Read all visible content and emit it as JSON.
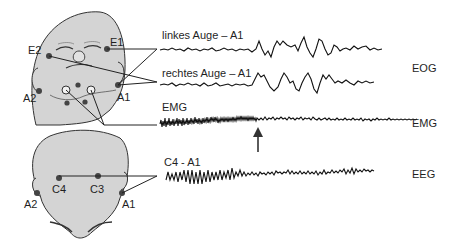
{
  "figure": {
    "face_electrodes": [
      {
        "id": "E1",
        "label": "E1"
      },
      {
        "id": "E2",
        "label": "E2"
      },
      {
        "id": "A1",
        "label": "A1"
      },
      {
        "id": "A2",
        "label": "A2"
      }
    ],
    "back_electrodes": [
      {
        "id": "C4",
        "label": "C4"
      },
      {
        "id": "C3",
        "label": "C3"
      },
      {
        "id": "A1",
        "label": "A1"
      },
      {
        "id": "A2",
        "label": "A2"
      }
    ],
    "traces": [
      {
        "name": "left-eye",
        "label": "linkes Auge – A1"
      },
      {
        "name": "right-eye",
        "label": "rechtes Auge – A1"
      },
      {
        "name": "emg",
        "label": "EMG"
      },
      {
        "name": "eeg",
        "label": "C4 - A1"
      }
    ],
    "channel_labels": {
      "eog": "EOG",
      "emg": "EMG",
      "eeg": "EEG"
    },
    "colors": {
      "skin": "#d4d4d4",
      "outline": "#333333",
      "electrode": "#444444",
      "trace": "#111111"
    }
  }
}
